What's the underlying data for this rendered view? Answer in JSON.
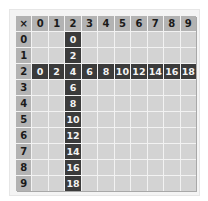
{
  "table": {
    "corner": "×",
    "col_headers": [
      "0",
      "1",
      "2",
      "3",
      "4",
      "5",
      "6",
      "7",
      "8",
      "9"
    ],
    "row_headers": [
      "0",
      "1",
      "2",
      "3",
      "4",
      "5",
      "6",
      "7",
      "8",
      "9"
    ],
    "highlight_row": 2,
    "highlight_col": 2,
    "highlight_row_values": [
      "0",
      "2",
      "4",
      "6",
      "8",
      "10",
      "12",
      "14",
      "16",
      "18"
    ],
    "highlight_col_values": [
      "0",
      "2",
      "4",
      "6",
      "8",
      "10",
      "12",
      "14",
      "16",
      "18"
    ]
  },
  "colors": {
    "header": "#b3b3b3",
    "body": "#d3d3d3",
    "highlight": "#3b3b3b",
    "grid_line": "#f2f2f2"
  }
}
